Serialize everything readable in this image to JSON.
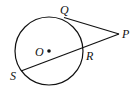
{
  "diagram": {
    "labels": {
      "Q": "Q",
      "P": "P",
      "O": "O",
      "R": "R",
      "S": "S"
    },
    "circle": {
      "cx": 49,
      "cy": 51,
      "r": 34,
      "center_label": "O"
    },
    "segments": [
      {
        "name": "tangent-QP",
        "from": "Q",
        "to": "P"
      },
      {
        "name": "secant-PS",
        "from": "P",
        "to": "S",
        "through": "R"
      }
    ],
    "colors": {
      "stroke": "#111111"
    }
  }
}
